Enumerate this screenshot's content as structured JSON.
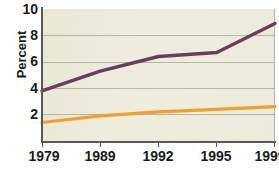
{
  "chart_data": {
    "type": "line",
    "title": "",
    "xlabel": "",
    "ylabel": "Percent",
    "categories": [
      "1979",
      "1989",
      "1992",
      "1995",
      "1999"
    ],
    "ylim": [
      0,
      10
    ],
    "yticks": [
      2,
      4,
      6,
      8,
      10
    ],
    "ytick_labels": [
      "2",
      "4",
      "6",
      "8",
      "10"
    ],
    "grid": "horizontal",
    "legend": "none",
    "plot_background": "#eceadb",
    "series": [
      {
        "name": "purple-series",
        "color": "#6d3b5e",
        "values": [
          3.8,
          5.3,
          6.4,
          6.7,
          8.9
        ]
      },
      {
        "name": "orange-series",
        "color": "#f0a030",
        "values": [
          1.4,
          1.9,
          2.2,
          2.4,
          2.6
        ]
      }
    ]
  }
}
